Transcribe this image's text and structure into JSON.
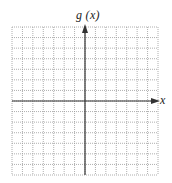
{
  "chart_data": {
    "type": "line",
    "title": "",
    "xlabel": "x",
    "ylabel": "g (x)",
    "grid": true,
    "grid_style": "dotted",
    "grid_cells": {
      "columns": 14,
      "rows": 14
    },
    "xlim": [
      -7,
      7
    ],
    "ylim": [
      -7,
      7
    ],
    "series": [],
    "tick_labels": {
      "x": [],
      "y": []
    }
  },
  "labels": {
    "y_axis": "g (x)",
    "x_axis": "x"
  },
  "colors": {
    "grid": "#9a9a9a",
    "axis": "#333333",
    "background": "#ffffff"
  }
}
